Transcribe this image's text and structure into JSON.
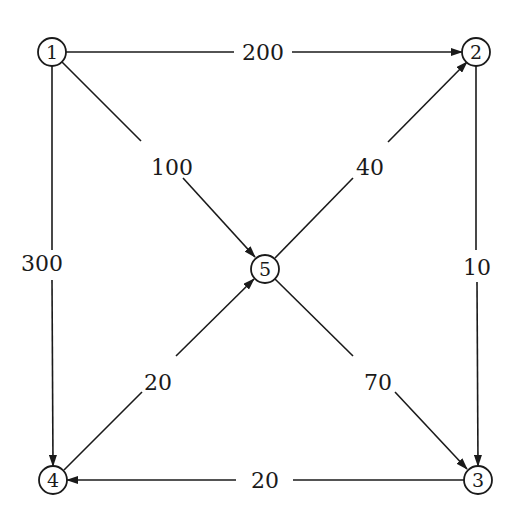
{
  "diagram": {
    "type": "directed-weighted-graph",
    "nodes": [
      {
        "id": "1",
        "label": "1",
        "x": 52,
        "y": 52
      },
      {
        "id": "2",
        "label": "2",
        "x": 476,
        "y": 52
      },
      {
        "id": "3",
        "label": "3",
        "x": 478,
        "y": 480
      },
      {
        "id": "4",
        "label": "4",
        "x": 53,
        "y": 480
      },
      {
        "id": "5",
        "label": "5",
        "x": 265,
        "y": 269
      }
    ],
    "edges": [
      {
        "from": "1",
        "to": "2",
        "weight": "200",
        "label_x": 263,
        "label_y": 52
      },
      {
        "from": "1",
        "to": "5",
        "weight": "100",
        "label_x": 172,
        "label_y": 167
      },
      {
        "from": "1",
        "to": "4",
        "weight": "300",
        "label_x": 35,
        "label_y": 263
      },
      {
        "from": "5",
        "to": "2",
        "weight": "40",
        "label_x": 368,
        "label_y": 167
      },
      {
        "from": "2",
        "to": "3",
        "weight": "10",
        "label_x": 476,
        "label_y": 267
      },
      {
        "from": "4",
        "to": "5",
        "weight": "20",
        "label_x": 158,
        "label_y": 382
      },
      {
        "from": "5",
        "to": "3",
        "weight": "70",
        "label_x": 378,
        "label_y": 382
      },
      {
        "from": "3",
        "to": "4",
        "weight": "20",
        "label_x": 265,
        "label_y": 480
      }
    ],
    "colors": {
      "stroke": "#1a1a1a",
      "background": "#ffffff"
    }
  }
}
